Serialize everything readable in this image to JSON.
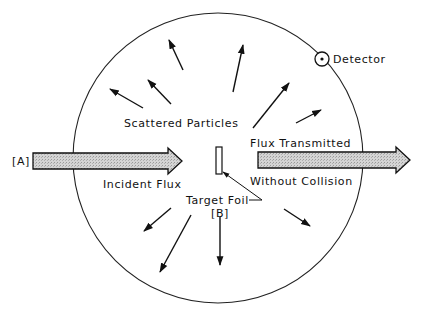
{
  "labels": {
    "scattered_particles": "Scattered Particles",
    "detector": "Detector",
    "incident_flux": "Incident Flux",
    "flux_transmitted": "Flux Transmitted",
    "without_collision": "Without Collision",
    "target_foil": "Target Foil",
    "marker_a": "[A]",
    "marker_b": "[B]"
  },
  "colors": {
    "line": "#111111",
    "beam_fill": "#c8c8c8",
    "background": "#ffffff"
  },
  "icons": {
    "detector": "detector-circle-icon",
    "scatter_arrow": "arrow-icon",
    "beam_arrow": "beam-arrow-icon"
  }
}
